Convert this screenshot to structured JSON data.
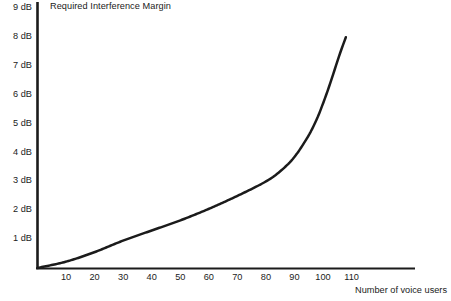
{
  "chart_data": {
    "type": "line",
    "title": "Required Interference Margin",
    "xlabel": "Number of voice users",
    "ylabel": "",
    "xlim": [
      0,
      120
    ],
    "ylim": [
      0,
      9
    ],
    "grid": false,
    "legend": "none",
    "x_tick_labels": [
      "10",
      "20",
      "30",
      "40",
      "50",
      "60",
      "70",
      "80",
      "90",
      "100",
      "110"
    ],
    "x_ticks": [
      10,
      20,
      30,
      40,
      50,
      60,
      70,
      80,
      90,
      100,
      110
    ],
    "y_tick_labels": [
      "1 dB",
      "2 dB",
      "3 dB",
      "4 dB",
      "5 dB",
      "6 dB",
      "7 dB",
      "8 dB",
      "9 dB"
    ],
    "y_ticks": [
      1,
      2,
      3,
      4,
      5,
      6,
      7,
      8,
      9
    ],
    "series": [
      {
        "name": "Required Interference Margin",
        "color": "#1b1b1b",
        "x": [
          0,
          10,
          20,
          30,
          40,
          50,
          60,
          70,
          80,
          85,
          90,
          95,
          98,
          100,
          102,
          104,
          106,
          108
        ],
        "y": [
          0,
          0.22,
          0.55,
          0.95,
          1.3,
          1.65,
          2.05,
          2.5,
          3.0,
          3.35,
          3.85,
          4.6,
          5.2,
          5.7,
          6.25,
          6.85,
          7.45,
          8.0
        ]
      }
    ]
  },
  "axis": {
    "y_axis_name": "vertical-axis",
    "x_axis_name": "horizontal-axis"
  }
}
